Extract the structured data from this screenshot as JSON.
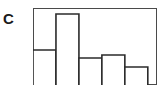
{
  "panel": {
    "label": "C"
  },
  "chart_data": {
    "type": "bar",
    "title": "",
    "subtitle": "",
    "xlabel": "",
    "ylabel": "",
    "categories": [
      "1",
      "2",
      "3",
      "4",
      "5"
    ],
    "values": [
      35,
      71,
      27,
      30,
      18
    ],
    "bin_edges": [
      0,
      1,
      2,
      3,
      4,
      5
    ],
    "xlim": [
      0,
      5.4
    ],
    "ylim": [
      0,
      77
    ],
    "grid": false,
    "legend": null,
    "legend_position": "none",
    "annotations": [],
    "tick_labels": {
      "x": [],
      "y": []
    },
    "style": {
      "bar_fill": "#ffffff",
      "bar_stroke": "#2b2b2b",
      "frame_stroke": "#4a4a4a",
      "background": "#ffffff"
    }
  }
}
